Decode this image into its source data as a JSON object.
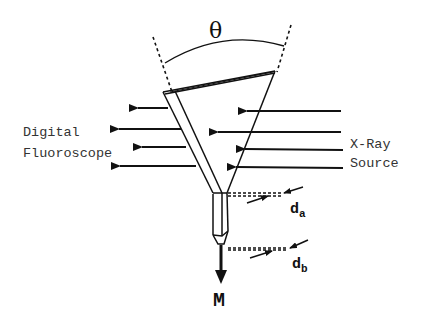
{
  "diagram": {
    "angle_label": "θ",
    "left_label_line1": "Digital",
    "left_label_line2": "Fluoroscope",
    "right_label_line1": "X-Ray",
    "right_label_line2": "Source",
    "dim_a_label": "d",
    "dim_a_sub": "a",
    "dim_b_label": "d",
    "dim_b_sub": "b",
    "motion_label": "M",
    "colors": {
      "ink": "#111111",
      "background": "#ffffff"
    }
  }
}
